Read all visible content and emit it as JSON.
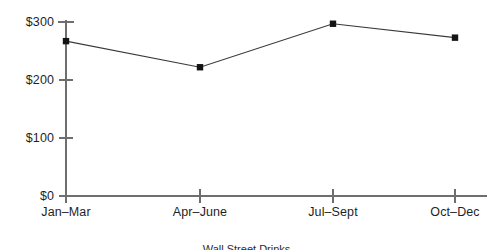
{
  "chart_data": {
    "type": "line",
    "title": "Wall Street Drinks",
    "categories": [
      "Jan–Mar",
      "Apr–June",
      "Jul–Sept",
      "Oct–Dec"
    ],
    "values": [
      267,
      222,
      297,
      273
    ],
    "xlabel": "",
    "ylabel": "",
    "ylim": [
      0,
      300
    ],
    "yticks": [
      0,
      100,
      200,
      300
    ],
    "ytick_labels": [
      "$0",
      "$100",
      "$200",
      "$300"
    ],
    "grid": false,
    "legend": false,
    "marker": "square",
    "series": [
      {
        "name": "",
        "values": [
          267,
          222,
          297,
          273
        ]
      }
    ]
  },
  "style": {
    "background": "#ffffff",
    "axis_color": "#6e6e6e",
    "line_color": "#3a3a3a",
    "marker_color": "#141414",
    "text_color": "#1f1f1f"
  }
}
